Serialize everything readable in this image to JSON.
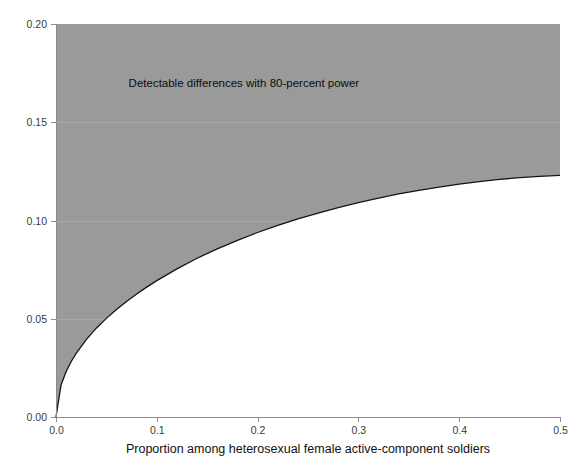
{
  "chart_data": {
    "type": "area",
    "title": "",
    "subtitle": "",
    "xlabel": "Proportion among heterosexual female active-component soldiers",
    "ylabel": "",
    "xlim": [
      0.0,
      0.5
    ],
    "ylim": [
      0.0,
      0.2
    ],
    "grid": true,
    "legend": "none",
    "annotations": [
      {
        "text": "Detectable differences with 80-percent power",
        "x": 0.072,
        "y": 0.168
      }
    ],
    "xticks": [
      0.0,
      0.1,
      0.2,
      0.3,
      0.4,
      0.5
    ],
    "xtick_labels": [
      "0.0",
      "0.1",
      "0.2",
      "0.3",
      "0.4",
      "0.5"
    ],
    "yticks": [
      0.0,
      0.05,
      0.1,
      0.15,
      0.2
    ],
    "ytick_labels": [
      "0.00",
      "0.05",
      "0.10",
      "0.15",
      "0.20"
    ],
    "series": [
      {
        "name": "Minimum detectable difference",
        "fill_above": true,
        "fill_color": "#9a9a9a",
        "line_color": "#141414",
        "x": [
          0.0,
          0.005,
          0.01,
          0.015,
          0.02,
          0.03,
          0.04,
          0.05,
          0.06,
          0.07,
          0.08,
          0.09,
          0.1,
          0.12,
          0.14,
          0.16,
          0.18,
          0.2,
          0.22,
          0.24,
          0.26,
          0.28,
          0.3,
          0.32,
          0.34,
          0.36,
          0.38,
          0.4,
          0.42,
          0.44,
          0.46,
          0.48,
          0.5
        ],
        "y": [
          0.0,
          0.0163,
          0.023,
          0.0281,
          0.0324,
          0.0394,
          0.0452,
          0.0502,
          0.0547,
          0.0588,
          0.0626,
          0.0661,
          0.0694,
          0.0754,
          0.0808,
          0.0856,
          0.0899,
          0.0939,
          0.0975,
          0.1008,
          0.1038,
          0.1066,
          0.1091,
          0.1114,
          0.1135,
          0.1153,
          0.117,
          0.1185,
          0.1198,
          0.1209,
          0.1218,
          0.1225,
          0.123
        ]
      }
    ],
    "colors": {
      "shaded_region": "#9a9a9a",
      "curve": "#141414",
      "background": "#ffffff",
      "axis": "#8c8c8c",
      "tick_text": "#3a3a3a",
      "axis_title_text": "#111111"
    }
  }
}
